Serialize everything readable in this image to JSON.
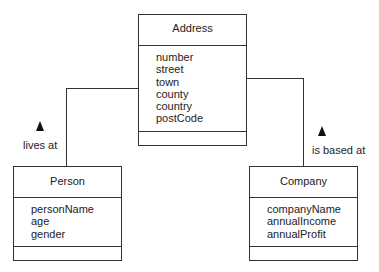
{
  "diagram": {
    "type": "UML class diagram",
    "classes": [
      {
        "name": "Address",
        "attributes": [
          "number",
          "street",
          "town",
          "county",
          "country",
          "postCode"
        ],
        "operations": []
      },
      {
        "name": "Person",
        "attributes": [
          "personName",
          "age",
          "gender"
        ],
        "operations": []
      },
      {
        "name": "Company",
        "attributes": [
          "companyName",
          "annualIncome",
          "annualProfit"
        ],
        "operations": []
      }
    ],
    "associations": [
      {
        "from": "Person",
        "to": "Address",
        "label": "lives at",
        "direction_arrow": "up"
      },
      {
        "from": "Company",
        "to": "Address",
        "label": "is based at",
        "direction_arrow": "up"
      }
    ]
  }
}
